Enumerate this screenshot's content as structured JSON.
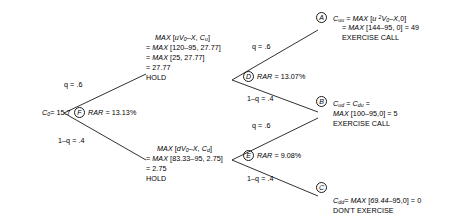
{
  "diagram": {
    "type": "binomial-option-pricing-tree",
    "root": {
      "value_label": "C",
      "value_sub": "0",
      "value_text": "= 15.7",
      "node_letter": "F",
      "rar_label": "RAR",
      "rar_value": "= 13.13%"
    },
    "branches": {
      "up": "q = .6",
      "down": "1–q = .4",
      "up_upper": "q = .6",
      "down_upper": "1–q = .4",
      "up_lower": "q = .6",
      "down_lower": "1–q = .4"
    },
    "upper_mid": {
      "line1_prefix": "MAX",
      "line1": "MAX [uV0–X, Cu]",
      "line2": "= MAX [120–95, 27.77]",
      "line3": "= MAX [25, 27.77]",
      "line4": "= 27.77",
      "line5": "HOLD",
      "node_letter": "D",
      "rar_label": "RAR",
      "rar_value": "= 13.07%"
    },
    "lower_mid": {
      "line1": "MAX [dV0–X, Cd]",
      "line2": "= MAX [83.33–95, 2.75]",
      "line3": "= 2.75",
      "line4": "HOLD",
      "node_letter": "E",
      "rar_label": "RAR",
      "rar_value": "= 9.08%"
    },
    "terminal_a": {
      "node_letter": "A",
      "symbol": "C",
      "symbol_sub": "uu",
      "line1": "= MAX [u 2V0–X,0]",
      "line2": "= MAX [144–95, 0] = 49",
      "line3": "EXERCISE CALL"
    },
    "terminal_b": {
      "node_letter": "B",
      "symbol": "C",
      "symbol_sub": "ud",
      "symbol2": "C",
      "symbol2_sub": "du",
      "line1": "= MAX [100–95,0] = 5",
      "line2": "EXERCISE CALL"
    },
    "terminal_c": {
      "node_letter": "C",
      "symbol": "C",
      "symbol_sub": "dd",
      "line1": "= MAX [69.44–95,0] = 0",
      "line2": "DON'T EXERCISE"
    }
  }
}
